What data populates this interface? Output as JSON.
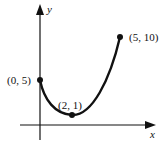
{
  "figure": {
    "type": "function-graph",
    "axes": {
      "x_label": "x",
      "y_label": "y"
    },
    "points": [
      {
        "label": "(0, 5)",
        "x": 0,
        "y": 5
      },
      {
        "label": "(2, 1)",
        "x": 2,
        "y": 1
      },
      {
        "label": "(5, 10)",
        "x": 5,
        "y": 10
      }
    ],
    "colors": {
      "curve": "#111111",
      "axes": "#111111",
      "background": "#ffffff"
    }
  }
}
